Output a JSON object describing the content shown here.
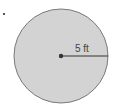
{
  "diagram": {
    "shape": "circle",
    "radius_label": "5 ft",
    "fill_color": "#d3d3d3",
    "stroke_color": "#6e6e6e",
    "line_color": "#333333"
  }
}
